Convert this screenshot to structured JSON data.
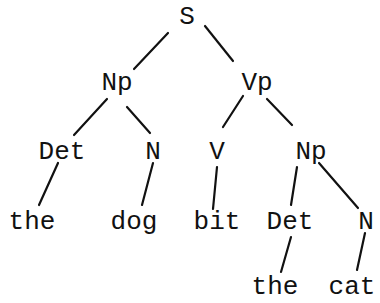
{
  "diagram": {
    "type": "parse-tree",
    "nodes": [
      {
        "id": "s",
        "label": "S",
        "x": 187,
        "y": 17
      },
      {
        "id": "np1",
        "label": "Np",
        "x": 117,
        "y": 83
      },
      {
        "id": "vp",
        "label": "Vp",
        "x": 257,
        "y": 83
      },
      {
        "id": "det1",
        "label": "Det",
        "x": 62,
        "y": 152
      },
      {
        "id": "n1",
        "label": "N",
        "x": 153,
        "y": 152
      },
      {
        "id": "v",
        "label": "V",
        "x": 217,
        "y": 152
      },
      {
        "id": "np2",
        "label": "Np",
        "x": 311,
        "y": 152
      },
      {
        "id": "the1",
        "label": "the",
        "x": 32,
        "y": 222
      },
      {
        "id": "dog",
        "label": "dog",
        "x": 134,
        "y": 222
      },
      {
        "id": "bit",
        "label": "bit",
        "x": 217,
        "y": 222
      },
      {
        "id": "det2",
        "label": "Det",
        "x": 290,
        "y": 222
      },
      {
        "id": "n2",
        "label": "N",
        "x": 366,
        "y": 222
      },
      {
        "id": "the2",
        "label": "the",
        "x": 275,
        "y": 287
      },
      {
        "id": "cat",
        "label": "cat",
        "x": 352,
        "y": 287
      }
    ],
    "edges": [
      {
        "x1": 168,
        "y1": 33,
        "x2": 134,
        "y2": 69
      },
      {
        "x1": 205,
        "y1": 26,
        "x2": 233,
        "y2": 61
      },
      {
        "x1": 107,
        "y1": 99,
        "x2": 74,
        "y2": 135
      },
      {
        "x1": 127,
        "y1": 107,
        "x2": 150,
        "y2": 133
      },
      {
        "x1": 243,
        "y1": 96,
        "x2": 223,
        "y2": 127
      },
      {
        "x1": 267,
        "y1": 99,
        "x2": 292,
        "y2": 125
      },
      {
        "x1": 58,
        "y1": 163,
        "x2": 39,
        "y2": 205
      },
      {
        "x1": 153,
        "y1": 163,
        "x2": 142,
        "y2": 205
      },
      {
        "x1": 217,
        "y1": 167,
        "x2": 213,
        "y2": 209
      },
      {
        "x1": 297,
        "y1": 167,
        "x2": 291,
        "y2": 205
      },
      {
        "x1": 319,
        "y1": 163,
        "x2": 358,
        "y2": 208
      },
      {
        "x1": 291,
        "y1": 237,
        "x2": 281,
        "y2": 272
      },
      {
        "x1": 365,
        "y1": 233,
        "x2": 357,
        "y2": 270
      }
    ]
  },
  "labels": {
    "s": "S",
    "np1": "Np",
    "vp": "Vp",
    "det1": "Det",
    "n1": "N",
    "v": "V",
    "np2": "Np",
    "the1": "the",
    "dog": "dog",
    "bit": "bit",
    "det2": "Det",
    "n2": "N",
    "the2": "the",
    "cat": "cat"
  },
  "sentence": "the dog bit the cat"
}
